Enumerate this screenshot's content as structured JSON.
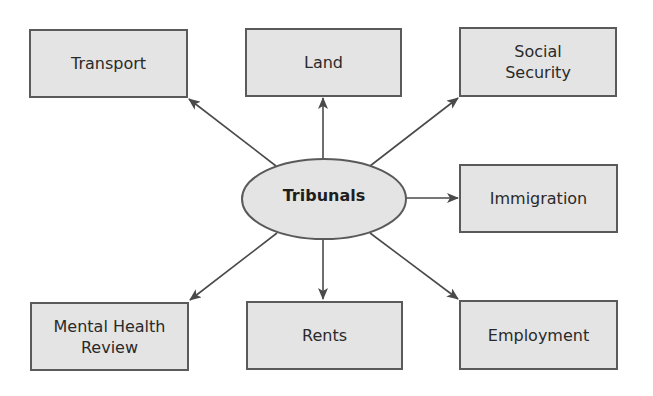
{
  "diagram": {
    "hub": {
      "label": "Tribunals"
    },
    "nodes": [
      {
        "id": "transport",
        "label": "Transport"
      },
      {
        "id": "land",
        "label": "Land"
      },
      {
        "id": "social-security",
        "label": "Social\nSecurity"
      },
      {
        "id": "immigration",
        "label": "Immigration"
      },
      {
        "id": "mental-health-review",
        "label": "Mental Health\nReview"
      },
      {
        "id": "rents",
        "label": "Rents"
      },
      {
        "id": "employment",
        "label": "Employment"
      }
    ],
    "colors": {
      "fill": "#e4e4e4",
      "stroke": "#5a5a5a",
      "arrow": "#4a4a4a",
      "text": "#2a2a2a"
    }
  }
}
